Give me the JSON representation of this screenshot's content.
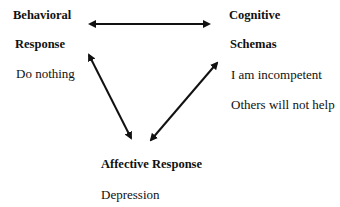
{
  "nodes": {
    "behavioral": {
      "title_line1": "Behavioral",
      "title_line2": "Response",
      "items": [
        "Do nothing"
      ]
    },
    "cognitive": {
      "title_line1": "Cognitive",
      "title_line2": "Schemas",
      "items": [
        "I am incompetent",
        "Others will not help"
      ]
    },
    "affective": {
      "title": "Affective Response",
      "items": [
        "Depression"
      ]
    }
  },
  "edges": [
    {
      "from": "behavioral",
      "to": "cognitive",
      "bidirectional": true
    },
    {
      "from": "behavioral",
      "to": "affective",
      "bidirectional": true
    },
    {
      "from": "cognitive",
      "to": "affective",
      "bidirectional": true
    }
  ]
}
